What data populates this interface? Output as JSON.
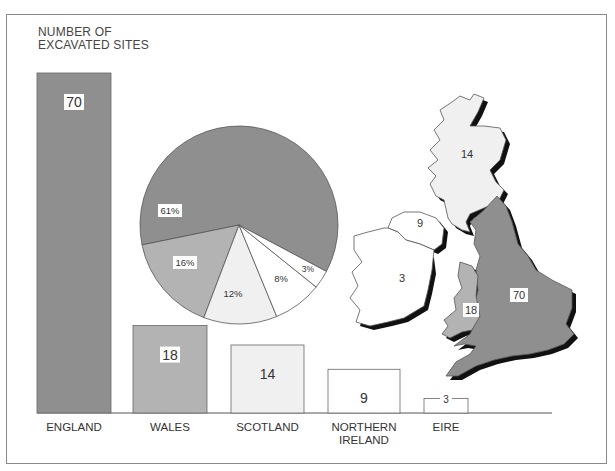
{
  "chart_data": [
    {
      "type": "bar",
      "title": "NUMBER OF EXCAVATED SITES",
      "title_lines": [
        "NUMBER OF",
        "EXCAVATED SITES"
      ],
      "categories": [
        "ENGLAND",
        "WALES",
        "SCOTLAND",
        "NORTHERN IRELAND",
        "EIRE"
      ],
      "category_lines": [
        [
          "ENGLAND"
        ],
        [
          "WALES"
        ],
        [
          "SCOTLAND"
        ],
        [
          "NORTHERN",
          "IRELAND"
        ],
        [
          "EIRE"
        ]
      ],
      "values": [
        70,
        18,
        14,
        9,
        3
      ],
      "value_labels": [
        "70",
        "18",
        "14",
        "9",
        "3"
      ],
      "colors": [
        "#8f8f8f",
        "#b3b3b3",
        "#f0f0f0",
        "#ffffff",
        "#ffffff"
      ],
      "xlabel": "",
      "ylabel": "Number of excavated sites",
      "grid": false
    },
    {
      "type": "pie",
      "labels": [
        "England",
        "Wales",
        "Scotland",
        "Northern Ireland",
        "Eire"
      ],
      "values": [
        61,
        16,
        12,
        8,
        3
      ],
      "value_labels": [
        "61%",
        "16%",
        "12%",
        "8%",
        "3%"
      ],
      "colors": [
        "#8f8f8f",
        "#b3b3b3",
        "#f0f0f0",
        "#ffffff",
        "#ffffff"
      ]
    },
    {
      "type": "map",
      "regions": [
        {
          "name": "Scotland",
          "value": "14",
          "color": "#f0f0f0"
        },
        {
          "name": "England",
          "value": "70",
          "color": "#8f8f8f"
        },
        {
          "name": "Wales",
          "value": "18",
          "color": "#b3b3b3"
        },
        {
          "name": "Northern Ireland",
          "value": "9",
          "color": "#ffffff"
        },
        {
          "name": "Eire",
          "value": "3",
          "color": "#ffffff"
        }
      ]
    }
  ]
}
